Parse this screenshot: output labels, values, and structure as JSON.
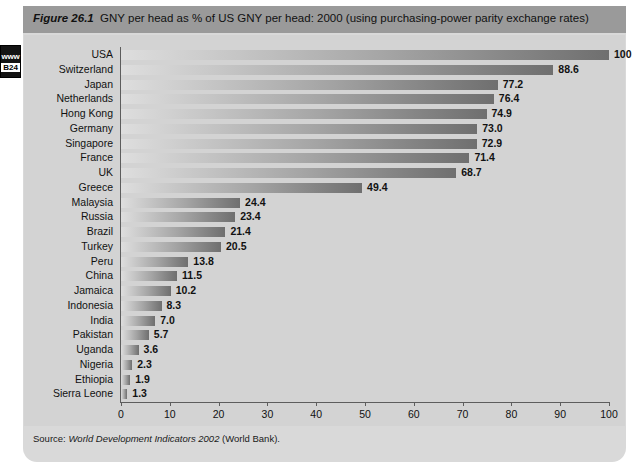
{
  "side_tab": {
    "www_label": "www",
    "code_label": "B24"
  },
  "figure": {
    "number_label": "Figure 26.1",
    "title": "GNY per head as % of US GNY per head: 2000 (using purchasing-power parity exchange rates)",
    "source_prefix": "Source:",
    "source_italic": "World Development Indicators 2002",
    "source_suffix": "(World Bank)."
  },
  "chart_data": {
    "type": "bar",
    "orientation": "horizontal",
    "title": "GNY per head as % of US GNY per head: 2000 (using purchasing-power parity exchange rates)",
    "xlabel": "",
    "ylabel": "",
    "xlim": [
      0,
      100
    ],
    "grid": false,
    "legend": false,
    "xticks": [
      0,
      10,
      20,
      30,
      40,
      50,
      60,
      70,
      80,
      90,
      100
    ],
    "xtick_labels": [
      "0",
      "10",
      "20",
      "30",
      "40",
      "50",
      "60",
      "70",
      "80",
      "90",
      "100"
    ],
    "categories": [
      "USA",
      "Switzerland",
      "Japan",
      "Netherlands",
      "Hong Kong",
      "Germany",
      "Singapore",
      "France",
      "UK",
      "Greece",
      "Malaysia",
      "Russia",
      "Brazil",
      "Turkey",
      "Peru",
      "China",
      "Jamaica",
      "Indonesia",
      "India",
      "Pakistan",
      "Uganda",
      "Nigeria",
      "Ethiopia",
      "Sierra Leone"
    ],
    "values": [
      100,
      88.6,
      77.2,
      76.4,
      74.9,
      73.0,
      72.9,
      71.4,
      68.7,
      49.4,
      24.4,
      23.4,
      21.4,
      20.5,
      13.8,
      11.5,
      10.2,
      8.3,
      7.0,
      5.7,
      3.6,
      2.3,
      1.9,
      1.3
    ],
    "value_labels": [
      "100",
      "88.6",
      "77.2",
      "76.4",
      "74.9",
      "73.0",
      "72.9",
      "71.4",
      "68.7",
      "49.4",
      "24.4",
      "23.4",
      "21.4",
      "20.5",
      "13.8",
      "11.5",
      "10.2",
      "8.3",
      "7.0",
      "5.7",
      "3.6",
      "2.3",
      "1.9",
      "1.3"
    ],
    "bar_color_start": "#dedede",
    "bar_color_end": "#6f6f6f",
    "panel_color": "#d3d3d3",
    "title_bar_color": "#9a9a9a"
  }
}
